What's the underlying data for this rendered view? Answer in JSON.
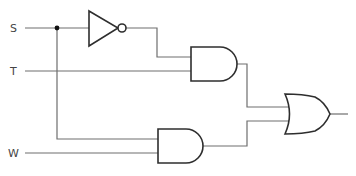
{
  "diagram": {
    "type": "logic-circuit",
    "inputs": [
      {
        "id": "S",
        "label": "S"
      },
      {
        "id": "T",
        "label": "T"
      },
      {
        "id": "W",
        "label": "W"
      }
    ],
    "gates": [
      {
        "id": "not1",
        "type": "NOT",
        "inputs": [
          "S"
        ]
      },
      {
        "id": "and1",
        "type": "AND",
        "inputs": [
          "not1",
          "T"
        ]
      },
      {
        "id": "and2",
        "type": "AND",
        "inputs": [
          "S",
          "W"
        ]
      },
      {
        "id": "or1",
        "type": "OR",
        "inputs": [
          "and1",
          "and2"
        ]
      }
    ],
    "output": "or1",
    "colors": {
      "wire": "#6e6e6e",
      "gate_stroke": "#2e2e2e",
      "junction": "#111111"
    }
  }
}
